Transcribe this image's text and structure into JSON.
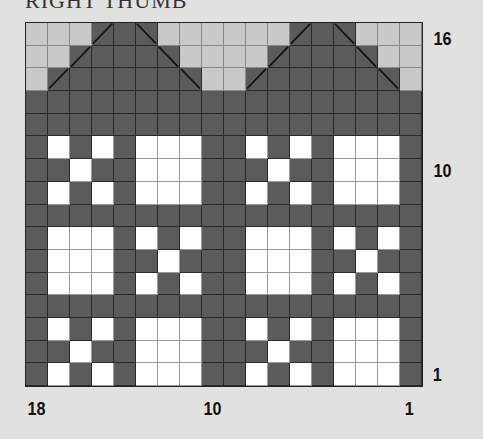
{
  "title": "RIGHT THUMB",
  "chart": {
    "columns": 18,
    "rows": 16,
    "legend_colors": {
      "L": "#c9c9c7",
      "D": "#5b5b5b",
      "W": "#ffffff"
    },
    "grid": [
      "LLLDDDLLLLLLDDDLLL",
      "LLDDDDDLLLLDDDDDLL",
      "LDDDDDDDLLDDDDDDDL",
      "DDDDDDDDDDDDDDDDDD",
      "DDDDDDDDDDDDDDDDDD",
      "DWDWDWWWDDWDWDWWWD",
      "DDWDDWWWDDDWDDWWWD",
      "DWDWDWWWDDWDWDWWWD",
      "DDDDDDDDDDDDDDDDDD",
      "DWWWDWDWDDWWWDWDWD",
      "DWWWDDWDDDWWWDDWDD",
      "DWWWDWDWDDWWWDWDWD",
      "DDDDDDDDDDDDDDDDDD",
      "DWDWDWWWDDWDWDWWWD",
      "DDWDDWWWDDDWDDWWWD",
      "DWDWDWWWDDWDWDWWWD"
    ],
    "diagonals": [
      {
        "row": 0,
        "col": 3,
        "dir": "/"
      },
      {
        "row": 1,
        "col": 2,
        "dir": "/"
      },
      {
        "row": 2,
        "col": 1,
        "dir": "/"
      },
      {
        "row": 0,
        "col": 5,
        "dir": "\\"
      },
      {
        "row": 1,
        "col": 6,
        "dir": "\\"
      },
      {
        "row": 2,
        "col": 7,
        "dir": "\\"
      },
      {
        "row": 0,
        "col": 12,
        "dir": "/"
      },
      {
        "row": 1,
        "col": 11,
        "dir": "/"
      },
      {
        "row": 2,
        "col": 10,
        "dir": "/"
      },
      {
        "row": 0,
        "col": 14,
        "dir": "\\"
      },
      {
        "row": 1,
        "col": 15,
        "dir": "\\"
      },
      {
        "row": 2,
        "col": 16,
        "dir": "\\"
      }
    ]
  },
  "row_labels": [
    {
      "text": "16",
      "top": 28
    },
    {
      "text": "10",
      "top": 160
    },
    {
      "text": "1",
      "top": 364
    }
  ],
  "col_labels": [
    {
      "text": "18",
      "left": 28
    },
    {
      "text": "10",
      "left": 203
    },
    {
      "text": "1",
      "left": 404
    }
  ]
}
